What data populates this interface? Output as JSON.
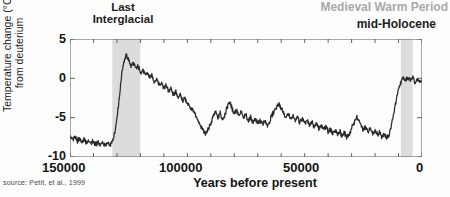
{
  "figure": {
    "source_note": "source: Petit, et al., 1999",
    "background_color": "#fdfdfd",
    "line_color": "#2b2b2b",
    "band_color": "#dcdcdc",
    "axis_color": "#555555"
  },
  "annotations": [
    {
      "name": "last-interglacial",
      "line1": "Last",
      "line2": "Interglacial",
      "color": "#1c1c1c",
      "x_value": 126000
    },
    {
      "name": "medieval-warm-period",
      "text": "Medieval Warm Period",
      "color": "#a9a9a9",
      "x_value": 1000
    },
    {
      "name": "mid-holocene",
      "text": "mid-Holocene",
      "color": "#1c1c1c",
      "x_value": 6000
    }
  ],
  "shaded_bands": [
    {
      "name": "last-interglacial-band",
      "x_start": 132000,
      "x_end": 120000,
      "color": "#dcdcdc"
    },
    {
      "name": "mid-holocene-band",
      "x_start": 9000,
      "x_end": 4000,
      "color": "#dcdcdc"
    }
  ],
  "chart_data": {
    "type": "line",
    "title": "",
    "subtitle": "",
    "xlabel": "Years before present",
    "ylabel_line1": "Temperature change (°C)",
    "ylabel_line2": "from deuterium",
    "xlim": [
      150000,
      0
    ],
    "ylim": [
      -10,
      5
    ],
    "x_ticks": [
      150000,
      100000,
      50000,
      0
    ],
    "x_tick_labels": [
      "150000",
      "100000",
      "50000",
      "0"
    ],
    "x_minor_tick_interval": 10000,
    "y_ticks": [
      5,
      0,
      -5,
      -10
    ],
    "y_tick_labels": [
      "5",
      "0",
      "-5",
      "-10"
    ],
    "grid": false,
    "legend": null,
    "x_axis_direction": "reversed",
    "series": [
      {
        "name": "Vostok temperature change from deuterium",
        "color": "#2b2b2b",
        "x": [
          150000,
          149000,
          148000,
          147000,
          146000,
          145000,
          144000,
          143000,
          142000,
          141000,
          140000,
          139000,
          138000,
          137000,
          136000,
          135000,
          134000,
          133000,
          132000,
          131000,
          130000,
          129000,
          128000,
          127000,
          126000,
          125000,
          124000,
          123000,
          122000,
          121000,
          120000,
          119000,
          118000,
          117000,
          116000,
          115000,
          114000,
          113000,
          112000,
          111000,
          110000,
          109000,
          108000,
          107000,
          106000,
          105000,
          104000,
          103000,
          102000,
          101000,
          100000,
          99000,
          98000,
          97000,
          96000,
          95000,
          94000,
          93000,
          92000,
          91000,
          90000,
          89000,
          88000,
          87000,
          86000,
          85000,
          84000,
          83000,
          82000,
          81000,
          80000,
          79000,
          78000,
          77000,
          76000,
          75000,
          74000,
          73000,
          72000,
          71000,
          70000,
          69000,
          68000,
          67000,
          66000,
          65000,
          64000,
          63000,
          62000,
          61000,
          60000,
          59000,
          58000,
          57000,
          56000,
          55000,
          54000,
          53000,
          52000,
          51000,
          50000,
          49000,
          48000,
          47000,
          46000,
          45000,
          44000,
          43000,
          42000,
          41000,
          40000,
          39000,
          38000,
          37000,
          36000,
          35000,
          34000,
          33000,
          32000,
          31000,
          30000,
          29000,
          28000,
          27000,
          26000,
          25000,
          24000,
          23000,
          22000,
          21000,
          20000,
          19000,
          18000,
          17000,
          16000,
          15000,
          14000,
          13000,
          12000,
          11000,
          10000,
          9000,
          8000,
          7000,
          6000,
          5000,
          4000,
          3000,
          2000,
          1000,
          0
        ],
        "y": [
          -7.5,
          -7.8,
          -7.4,
          -8.0,
          -7.6,
          -8.1,
          -7.7,
          -8.2,
          -7.9,
          -8.3,
          -8.0,
          -8.4,
          -8.1,
          -8.5,
          -8.2,
          -8.6,
          -8.3,
          -8.5,
          -8.1,
          -7.0,
          -5.0,
          -2.5,
          0.5,
          2.2,
          2.9,
          2.3,
          1.6,
          1.9,
          1.2,
          1.5,
          0.8,
          1.1,
          0.4,
          0.7,
          0.0,
          0.3,
          -0.4,
          -0.1,
          -0.8,
          -0.5,
          -1.2,
          -0.9,
          -1.6,
          -1.3,
          -2.0,
          -1.7,
          -2.4,
          -2.1,
          -2.8,
          -2.5,
          -3.2,
          -3.6,
          -4.0,
          -4.5,
          -5.0,
          -5.6,
          -6.2,
          -6.8,
          -7.0,
          -6.4,
          -5.8,
          -4.8,
          -4.2,
          -5.0,
          -4.4,
          -5.2,
          -4.6,
          -3.6,
          -3.0,
          -3.8,
          -4.4,
          -4.0,
          -4.8,
          -4.3,
          -5.1,
          -4.6,
          -5.4,
          -4.9,
          -5.6,
          -5.1,
          -5.8,
          -5.3,
          -5.9,
          -5.4,
          -6.0,
          -5.5,
          -4.8,
          -4.2,
          -3.6,
          -3.2,
          -3.8,
          -4.4,
          -5.0,
          -4.5,
          -5.2,
          -4.7,
          -5.4,
          -4.9,
          -5.6,
          -5.1,
          -5.8,
          -5.3,
          -6.0,
          -5.5,
          -6.2,
          -5.7,
          -6.4,
          -5.9,
          -6.6,
          -6.1,
          -6.8,
          -6.3,
          -7.0,
          -6.5,
          -7.2,
          -6.7,
          -7.4,
          -6.9,
          -7.6,
          -7.1,
          -6.4,
          -5.6,
          -4.9,
          -5.4,
          -6.0,
          -6.6,
          -6.2,
          -6.8,
          -6.4,
          -7.0,
          -6.6,
          -7.2,
          -6.8,
          -7.4,
          -7.0,
          -7.6,
          -7.2,
          -6.0,
          -4.4,
          -2.8,
          -1.4,
          -0.4,
          0.1,
          -0.3,
          0.2,
          -0.2,
          0.3,
          -0.6,
          0.0,
          -0.5,
          -0.2
        ]
      }
    ],
    "data_notes": {
      "glacial_minimum_approx_c": -8.5,
      "last_interglacial_peak_c": 2.9,
      "holocene_mean_c": 0.0,
      "units": "°C"
    }
  }
}
